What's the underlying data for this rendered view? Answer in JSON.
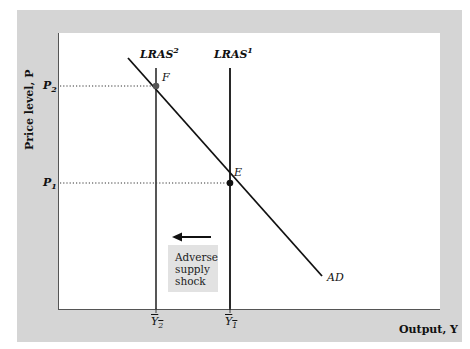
{
  "axes": {
    "y_label": "Price level, P",
    "x_label": "Output, Y"
  },
  "curves": {
    "lras2": {
      "name": "LRAS",
      "sup": "2"
    },
    "lras1": {
      "name": "LRAS",
      "sup": "1"
    },
    "ad": {
      "name": "AD"
    }
  },
  "points": {
    "f": "F",
    "e": "E"
  },
  "y_ticks": {
    "p2": {
      "base": "P",
      "sub": "2"
    },
    "p1": {
      "base": "P",
      "sub": "1"
    }
  },
  "x_ticks": {
    "y2": {
      "base": "Y",
      "sub": "2"
    },
    "y1": {
      "base": "Y",
      "sub": "1"
    }
  },
  "annotation": {
    "line1": "Adverse",
    "line2": "supply",
    "line3": "shock",
    "arrow_direction": "left"
  },
  "colors": {
    "frame": "#d5d5d5",
    "plot": "#ffffff",
    "lines": "#111111",
    "shock_box": "#e2e2e2"
  }
}
